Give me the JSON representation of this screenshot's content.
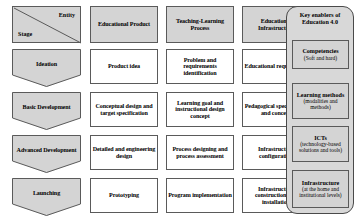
{
  "diagram": {
    "corner_header": {
      "entity_label": "Entity",
      "stage_label": "Stage"
    },
    "column_headers": [
      "Educational Product",
      "Teaching-Learning Process",
      "Educational Infrastructure"
    ],
    "stages": [
      "Ideation",
      "Basic Development",
      "Advanced Development",
      "Launching"
    ],
    "rows": [
      {
        "stage": "Ideation",
        "educational_product": "Product idea",
        "teaching_learning_process": "Problem and requirements identification",
        "educational_infrastructure": "Educational requirement"
      },
      {
        "stage": "Basic Development",
        "educational_product": "Conceptual design and target specification",
        "teaching_learning_process": "Learning goal and instructional design concept",
        "educational_infrastructure": "Pedagogical specification and concept"
      },
      {
        "stage": "Advanced Development",
        "educational_product": "Detailed and engineering design",
        "teaching_learning_process": "Process designing and process assessment",
        "educational_infrastructure": "Infrastructure configuration"
      },
      {
        "stage": "Launching",
        "educational_product": "Prototyping",
        "teaching_learning_process": "Program implementation",
        "educational_infrastructure": "Infrastructure construction and installation"
      }
    ],
    "key_enablers_panel": {
      "title": "Key enablers of Education 4.0",
      "items": [
        {
          "name": "Competencies",
          "detail": "(Soft and hard)"
        },
        {
          "name": "Learning methods",
          "detail": "(modalities and methods)"
        },
        {
          "name": "ICTs",
          "detail": "(technology-based solutions and tools)"
        },
        {
          "name": "Infrastructure",
          "detail": "(at the home and institutional levels)"
        }
      ]
    },
    "connector_arrows": {
      "count": 4,
      "direction": "left",
      "from": "key-enablers-panel",
      "to": "educational-infrastructure-column"
    },
    "colors": {
      "header_fill": "#d4d4d4",
      "box_fill": "#ffffff",
      "panel_fill": "#d8d8d8",
      "stroke": "#5a5a5a",
      "text": "#000000"
    }
  }
}
